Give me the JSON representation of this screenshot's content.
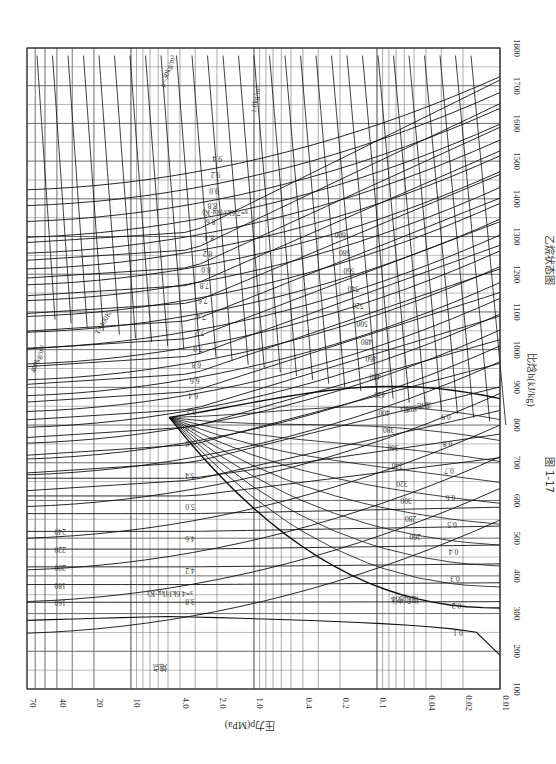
{
  "figure": {
    "number": "图 1-17",
    "caption": "乙烷状态图"
  },
  "chart_data": {
    "type": "line",
    "title": "乙烷状态图",
    "subtitle": "图 1-17",
    "orientation": "rotated-90-clockwise",
    "xlabel": "比焓h(kJ/kg)",
    "ylabel": "压力p(MPa)",
    "x_axis": {
      "quantity": "specific enthalpy",
      "unit": "kJ/kg",
      "range": [
        100,
        1800
      ],
      "ticks": [
        100,
        200,
        300,
        400,
        500,
        600,
        700,
        800,
        900,
        1000,
        1100,
        1200,
        1300,
        1400,
        1500,
        1600,
        1700,
        1800
      ]
    },
    "y_axis": {
      "quantity": "pressure",
      "unit": "MPa",
      "scale": "log",
      "range": [
        0.01,
        70
      ],
      "ticks": [
        0.01,
        0.02,
        0.04,
        0.1,
        0.2,
        0.4,
        1.0,
        2.0,
        4.0,
        10,
        20,
        40,
        70
      ]
    },
    "grid": true,
    "series": [
      {
        "name": "saturated liquid line",
        "label": "饱和液体"
      },
      {
        "name": "saturated vapor line",
        "label": "饱和蒸汽"
      },
      {
        "name": "melting line",
        "label": "熔点"
      },
      {
        "name": "isotherms",
        "unit": "K",
        "label_prefix": "T=",
        "values": [
          160,
          180,
          200,
          220,
          240,
          260,
          280,
          300,
          320,
          340,
          360,
          380,
          400,
          420,
          440,
          460,
          480,
          500,
          520,
          540,
          560,
          580,
          600
        ]
      },
      {
        "name": "isentropes",
        "unit": "kJ/(kg·K)",
        "label_prefix": "s=",
        "values": [
          3.8,
          4.2,
          4.6,
          5.0,
          5.4,
          5.8,
          6.0,
          6.2,
          6.4,
          6.6,
          6.8,
          7.0,
          7.2,
          7.4,
          7.6,
          7.8,
          8.0,
          8.2,
          8.4,
          8.6,
          8.8,
          9.0,
          9.2,
          9.4
        ]
      },
      {
        "name": "isochores (density)",
        "unit": "kg/m³",
        "values": [
          550,
          500,
          450,
          400,
          350,
          300,
          250,
          200,
          150,
          100,
          70,
          50,
          40,
          30,
          20,
          15,
          10,
          7.0,
          5.0,
          4.0,
          3.0,
          2.0,
          1.5,
          1.0,
          0.7,
          0.5,
          0.4,
          0.3,
          0.2
        ]
      },
      {
        "name": "quality lines",
        "label": "湿饱和度x",
        "values": [
          0.1,
          0.2,
          0.3,
          0.4,
          0.5,
          0.6,
          0.7,
          0.8,
          0.9
        ]
      }
    ],
    "annotations": [
      "T=400K",
      "s=7.6kJ/(kg·K)",
      "s=4.6kJ/(kg·K)",
      "1.0kg/m³",
      "ρ=30kg/m³",
      "400kg/m³",
      "熔点",
      "饱和液体",
      "湿饱和度x"
    ]
  },
  "labels": {
    "x_axis_title": "比焓h(kJ/kg)",
    "y_axis_title": "压力p(MPa)",
    "enthalpy_ticks": [
      "100",
      "200",
      "300",
      "400",
      "500",
      "600",
      "700",
      "800",
      "900",
      "1000",
      "1100",
      "1200",
      "1300",
      "1400",
      "1500",
      "1600",
      "1700",
      "1800"
    ],
    "pressure_ticks": [
      "70",
      "40",
      "20",
      "10",
      "4.0",
      "2.0",
      "1.0",
      "0.4",
      "0.2",
      "0.1",
      "0.04",
      "0.02",
      "0.01"
    ],
    "melting": "熔点",
    "sat_liquid": "饱和液体",
    "quality": "湿饱和度x",
    "s46": "s=4.6kJ/(kg·K)",
    "s76": "s=7.6kJ/(kg·K)",
    "t400": "T=400K",
    "rho1": "1.0kg/m³",
    "rho30": "ρ=30kg/m³",
    "rho400": "400kg/m³"
  }
}
